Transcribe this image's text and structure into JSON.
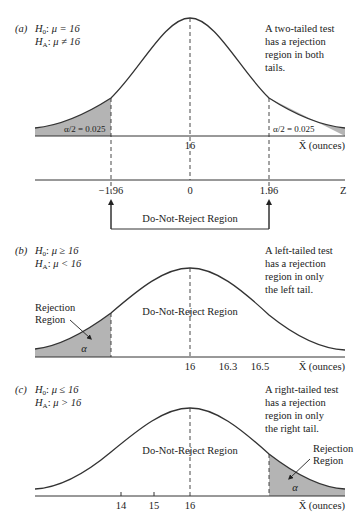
{
  "colors": {
    "shade": "#b4b4b4",
    "curve": "#333333",
    "text": "#222222",
    "background": "#ffffff"
  },
  "panels": {
    "a": {
      "tag": "(a)",
      "h0": "μ = 16",
      "ha": "μ ≠ 16",
      "h0_prefix": "H",
      "h0_sub": "0",
      "ha_prefix": "H",
      "ha_sub": "A",
      "note": [
        "A two-tailed test",
        "has a rejection",
        "region in both",
        "tails."
      ],
      "left_tail_label": "α/2 = 0.025",
      "right_tail_label": "α/2 = 0.025",
      "x_center_label": "16",
      "x_axis_label": "X̄ (ounces)",
      "z_ticks": [
        "−1.96",
        "0",
        "1.96"
      ],
      "z_axis_label": "Z",
      "bracket_label": "Do-Not-Reject Region"
    },
    "b": {
      "tag": "(b)",
      "h0": "μ ≥ 16",
      "ha": "μ < 16",
      "h0_prefix": "H",
      "h0_sub": "0",
      "ha_prefix": "H",
      "ha_sub": "A",
      "note": [
        "A left-tailed test",
        "has a rejection",
        "region in only",
        "the left tail."
      ],
      "rejection_label": [
        "Rejection",
        "Region"
      ],
      "alpha": "α",
      "dnr_label": "Do-Not-Reject Region",
      "x_ticks": [
        "16",
        "16.3",
        "16.5"
      ],
      "x_axis_label": "X̄ (ounces)"
    },
    "c": {
      "tag": "(c)",
      "h0": "μ ≤ 16",
      "ha": "μ > 16",
      "h0_prefix": "H",
      "h0_sub": "0",
      "ha_prefix": "H",
      "ha_sub": "A",
      "note": [
        "A right-tailed test",
        "has a rejection",
        "region in only",
        "the right tail."
      ],
      "rejection_label": [
        "Rejection",
        "Region"
      ],
      "alpha": "α",
      "dnr_label": "Do-Not-Reject Region",
      "x_ticks": [
        "14",
        "15",
        "16"
      ],
      "x_axis_label": "X̄ (ounces)"
    }
  }
}
